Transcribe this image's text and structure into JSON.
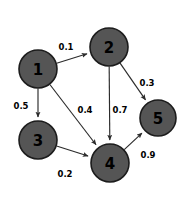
{
  "figure": {
    "background_color": "#ffffff"
  },
  "chart_data": {
    "type": "diagram",
    "diagram_kind": "weighted-directed-graph",
    "title": "",
    "node_fill_color": "#555555",
    "node_stroke_color": "#1c1c1c",
    "edge_color": "#2b2b2b",
    "label_color": "#000000",
    "node_radius": 19,
    "nodes": [
      {
        "id": "1",
        "label": "1",
        "x": 38,
        "y": 69,
        "r": 19
      },
      {
        "id": "2",
        "label": "2",
        "x": 109,
        "y": 47,
        "r": 19
      },
      {
        "id": "3",
        "label": "3",
        "x": 38,
        "y": 140,
        "r": 19
      },
      {
        "id": "4",
        "label": "4",
        "x": 110,
        "y": 163,
        "r": 19
      },
      {
        "id": "5",
        "label": "5",
        "x": 158,
        "y": 118,
        "r": 18
      }
    ],
    "edges": [
      {
        "id": "e1",
        "from": "1",
        "to": "2",
        "weight": "0.1",
        "label_x": 66,
        "label_y": 47,
        "directed": true
      },
      {
        "id": "e2",
        "from": "1",
        "to": "3",
        "weight": "0.5",
        "label_x": 21,
        "label_y": 106,
        "directed": true
      },
      {
        "id": "e3",
        "from": "1",
        "to": "4",
        "weight": "0.4",
        "label_x": 85,
        "label_y": 110,
        "directed": true
      },
      {
        "id": "e4",
        "from": "2",
        "to": "4",
        "weight": "0.7",
        "label_x": 120,
        "label_y": 110,
        "directed": true
      },
      {
        "id": "e5",
        "from": "2",
        "to": "5",
        "weight": "0.3",
        "label_x": 147,
        "label_y": 83,
        "directed": true
      },
      {
        "id": "e6",
        "from": "3",
        "to": "4",
        "weight": "0.2",
        "label_x": 65,
        "label_y": 174,
        "directed": true
      },
      {
        "id": "e7",
        "from": "4",
        "to": "5",
        "weight": "0.9",
        "label_x": 148,
        "label_y": 155,
        "directed": true
      }
    ]
  }
}
